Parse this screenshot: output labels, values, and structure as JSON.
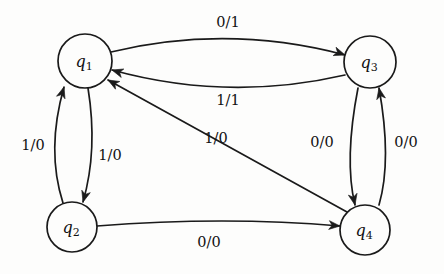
{
  "diagram": {
    "type": "finite-state-machine",
    "title": "",
    "background_color": "#fdfdfc",
    "stroke_color": "#1a1a1a",
    "states": [
      {
        "id": "q1",
        "base": "q",
        "subscript": "1",
        "cx": 85,
        "cy": 61,
        "r": 27
      },
      {
        "id": "q3",
        "base": "q",
        "subscript": "3",
        "cx": 370,
        "cy": 62,
        "r": 26
      },
      {
        "id": "q2",
        "base": "q",
        "subscript": "2",
        "cx": 72,
        "cy": 227,
        "r": 25
      },
      {
        "id": "q4",
        "base": "q",
        "subscript": "4",
        "cx": 365,
        "cy": 230,
        "r": 25
      }
    ],
    "transitions": [
      {
        "id": "t1",
        "from": "q1",
        "to": "q3",
        "input": "0",
        "output": "1",
        "label": "0/1",
        "label_x": 228,
        "label_y": 27,
        "path": "M 111 52 Q 228 24 345 55",
        "arrow": {
          "x": 345,
          "y": 55,
          "angle": 19
        }
      },
      {
        "id": "t2",
        "from": "q3",
        "to": "q1",
        "input": "1",
        "output": "1",
        "label": "1/1",
        "label_x": 228,
        "label_y": 105,
        "path": "M 345 75 Q 228 102 112 70",
        "arrow": {
          "x": 112,
          "y": 70,
          "angle": 197
        }
      },
      {
        "id": "t3",
        "from": "q2",
        "to": "q1",
        "input": "1",
        "output": "0",
        "label": "1/0",
        "label_x": 33,
        "label_y": 150,
        "path": "M 63 203 Q 46 150 64 87",
        "arrow": {
          "x": 64,
          "y": 87,
          "angle": -73
        }
      },
      {
        "id": "t4",
        "from": "q1",
        "to": "q2",
        "input": "1",
        "output": "0",
        "label": "1/0",
        "label_x": 110,
        "label_y": 160,
        "path": "M 88 88 Q 98 150 83 202",
        "arrow": {
          "x": 83,
          "y": 202,
          "angle": 106
        }
      },
      {
        "id": "t5",
        "from": "q4",
        "to": "q1",
        "input": "1",
        "output": "0",
        "label": "1/0",
        "label_x": 216,
        "label_y": 143,
        "path": "M 347 212 L 108 80",
        "arrow": {
          "x": 108,
          "y": 80,
          "angle": 209
        }
      },
      {
        "id": "t6",
        "from": "q3",
        "to": "q4",
        "input": "0",
        "output": "0",
        "label": "0/0",
        "label_x": 322,
        "label_y": 147,
        "path": "M 358 88 Q 344 160 355 205",
        "arrow": {
          "x": 355,
          "y": 205,
          "angle": 78
        }
      },
      {
        "id": "t7",
        "from": "q4",
        "to": "q3",
        "input": "0",
        "output": "0",
        "label": "0/0",
        "label_x": 406,
        "label_y": 147,
        "path": "M 379 205 Q 392 160 379 88",
        "arrow": {
          "x": 379,
          "y": 88,
          "angle": -101
        }
      },
      {
        "id": "t8",
        "from": "q2",
        "to": "q4",
        "input": "0",
        "output": "0",
        "label": "0/0",
        "label_x": 209,
        "label_y": 247,
        "path": "M 97 226 Q 225 216 340 226",
        "arrow": {
          "x": 340,
          "y": 226,
          "angle": 5
        }
      }
    ]
  }
}
